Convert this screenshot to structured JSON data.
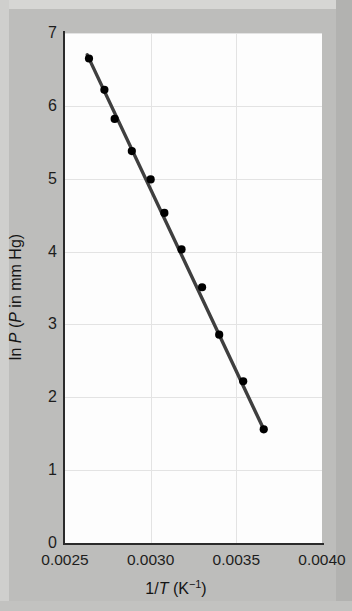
{
  "figure": {
    "caption_present": false,
    "background_color": "#bdbdbb",
    "panel_color": "#fdfdfd"
  },
  "chart_data": {
    "type": "scatter",
    "title": "",
    "subtitle": "",
    "xlabel": "1/T (K⁻¹)",
    "xlabel_parts": {
      "prefix": "1/",
      "italic": "T",
      "suffix": " (K",
      "sup": "−1",
      "tail": ")"
    },
    "ylabel": "ln P (P in mm Hg)",
    "ylabel_parts": {
      "lead": "ln ",
      "italic1": "P",
      "mid": " (",
      "italic2": "P",
      "tail": " in mm Hg)"
    },
    "xlim": [
      0.0025,
      0.004
    ],
    "ylim": [
      0,
      7
    ],
    "xticks": [
      "0.0025",
      "0.0030",
      "0.0035",
      "0.0040"
    ],
    "xtick_values": [
      0.0025,
      0.003,
      0.0035,
      0.004
    ],
    "yticks": [
      "0",
      "1",
      "2",
      "3",
      "4",
      "5",
      "6",
      "7"
    ],
    "ytick_values": [
      0,
      1,
      2,
      3,
      4,
      5,
      6,
      7
    ],
    "grid": "both",
    "grid_color": "#e3e3e3",
    "legend": "none",
    "marker": {
      "shape": "circle",
      "color": "#000000",
      "size": 7
    },
    "line": {
      "color": "#3f3f3f",
      "width": 3.4,
      "style": "solid",
      "fit": "linear"
    },
    "x": [
      0.00264,
      0.00273,
      0.00279,
      0.00289,
      0.003,
      0.00308,
      0.00318,
      0.0033,
      0.0034,
      0.00354,
      0.00366
    ],
    "y": [
      6.65,
      6.22,
      5.82,
      5.38,
      4.99,
      4.53,
      4.03,
      3.51,
      2.86,
      2.22,
      1.56
    ],
    "points": [
      {
        "x": 0.00264,
        "y": 6.65
      },
      {
        "x": 0.00273,
        "y": 6.22
      },
      {
        "x": 0.00279,
        "y": 5.82
      },
      {
        "x": 0.00289,
        "y": 5.38
      },
      {
        "x": 0.003,
        "y": 4.99
      },
      {
        "x": 0.00308,
        "y": 4.53
      },
      {
        "x": 0.00318,
        "y": 4.03
      },
      {
        "x": 0.0033,
        "y": 3.51
      },
      {
        "x": 0.0034,
        "y": 2.86
      },
      {
        "x": 0.00354,
        "y": 2.22
      },
      {
        "x": 0.00366,
        "y": 1.56
      }
    ],
    "fit_line": {
      "x_start": 0.00263,
      "y_start": 6.7,
      "x_end": 0.00366,
      "y_end": 1.56
    }
  }
}
